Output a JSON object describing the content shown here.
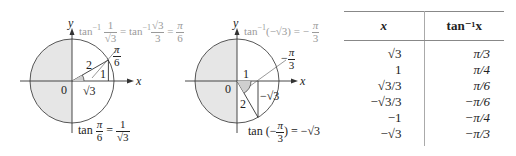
{
  "left_figure": {
    "axis_x_label": "x",
    "axis_y_label": "y",
    "origin_label": "0",
    "hypotenuse_label": "2",
    "opposite_label": "1",
    "adjacent_label": "√3",
    "angle_label_num": "π",
    "angle_label_den": "6",
    "top_equation": {
      "lhs_prefix": "tan",
      "lhs_sup": "−1",
      "lhs_num": "1",
      "lhs_den": "√3",
      "mid_prefix": "= tan",
      "mid_sup": "−1",
      "mid_num": "√3",
      "mid_den": "3",
      "eq": "=",
      "rhs_num": "π",
      "rhs_den": "6"
    },
    "bottom_equation": {
      "prefix": "tan",
      "angle_num": "π",
      "angle_den": "6",
      "eq": "=",
      "rhs_num": "1",
      "rhs_den": "√3"
    }
  },
  "right_figure": {
    "axis_x_label": "x",
    "axis_y_label": "y",
    "origin_label": "0",
    "hypotenuse_label": "2",
    "adjacent_label": "1",
    "opposite_label": "−√3",
    "angle_label_sign": "−",
    "angle_label_num": "π",
    "angle_label_den": "3",
    "top_equation": {
      "prefix": "tan",
      "sup": "−1",
      "arg": "(−√3)",
      "eq": "= −",
      "rhs_num": "π",
      "rhs_den": "3"
    },
    "bottom_equation": {
      "prefix": "tan",
      "open": "(−",
      "angle_num": "π",
      "angle_den": "3",
      "close": ")",
      "rhs": "= −√3"
    }
  },
  "table": {
    "headers": [
      "x",
      "tan⁻¹x"
    ],
    "rows": [
      {
        "x": "√3",
        "value": "π/3"
      },
      {
        "x": "1",
        "value": "π/4"
      },
      {
        "x": "√3/3",
        "value": "π/6"
      },
      {
        "x": "−√3/3",
        "value": "−π/6"
      },
      {
        "x": "−1",
        "value": "−π/4"
      },
      {
        "x": "−√3",
        "value": "−π/3"
      }
    ]
  },
  "colors": {
    "shade": "#e6e6e6",
    "stroke": "#333333",
    "faint_text": "#9a9a9a",
    "rule": "#888888"
  }
}
